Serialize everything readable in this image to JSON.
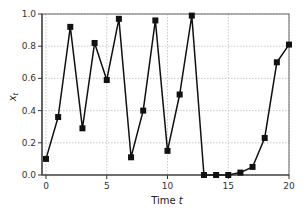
{
  "chart_data": {
    "type": "line",
    "title": "",
    "xlabel": "Time t",
    "ylabel": "x_t",
    "xlim": [
      0,
      20
    ],
    "ylim": [
      0.0,
      1.0
    ],
    "x_ticks": [
      "0",
      "5",
      "10",
      "15",
      "20"
    ],
    "y_ticks": [
      "0.0",
      "0.2",
      "0.4",
      "0.6",
      "0.8",
      "1.0"
    ],
    "grid": true,
    "legend": null,
    "series": [
      {
        "name": "x_t",
        "marker": "square",
        "color": "#111111",
        "x": [
          0,
          1,
          2,
          3,
          4,
          5,
          6,
          7,
          8,
          9,
          10,
          11,
          12,
          13,
          14,
          15,
          16,
          17,
          18,
          19,
          20
        ],
        "values": [
          0.1,
          0.36,
          0.92,
          0.29,
          0.82,
          0.59,
          0.97,
          0.11,
          0.4,
          0.96,
          0.15,
          0.5,
          0.99,
          0.0,
          0.0,
          0.0,
          0.015,
          0.05,
          0.23,
          0.7,
          0.81
        ]
      }
    ]
  }
}
